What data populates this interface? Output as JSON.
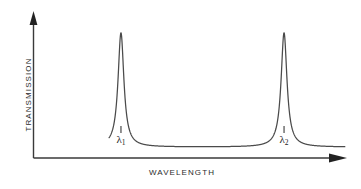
{
  "figure": {
    "background_color": "#ffffff",
    "line_color": "#3a3a3a",
    "text_color": "#2b2b2b"
  },
  "axes": {
    "y_label": "TRANSMISSION",
    "x_label": "WAVELENGTH",
    "y_arrow": "up-arrowhead",
    "x_arrow": "right-arrowhead"
  },
  "annotations": {
    "peak_1": {
      "symbol": "λ",
      "subscript": "1"
    },
    "peak_2": {
      "symbol": "λ",
      "subscript": "2"
    }
  },
  "chart_data": {
    "type": "line",
    "title": "",
    "xlabel": "WAVELENGTH",
    "ylabel": "TRANSMISSION",
    "grid": false,
    "legend": null,
    "xlim": [
      0,
      1
    ],
    "ylim": [
      0,
      1
    ],
    "axis_ticks": {
      "x": [],
      "y": []
    },
    "series": [
      {
        "name": "transmission",
        "baseline_level": 0.08,
        "peaks": [
          {
            "label": "λ1",
            "center_x": 0.295,
            "height": 0.92,
            "half_width": 0.012
          },
          {
            "label": "λ2",
            "center_x": 0.845,
            "height": 0.92,
            "half_width": 0.012
          }
        ],
        "curve_x_start": 0.255,
        "curve_x_end": 1.255
      }
    ],
    "tick_marks": [
      {
        "label": "λ1",
        "x": 0.295
      },
      {
        "label": "λ2",
        "x": 0.845
      }
    ]
  }
}
